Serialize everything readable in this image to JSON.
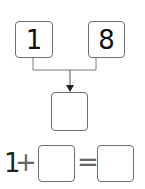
{
  "diagram": {
    "type": "number-bond",
    "top_boxes": [
      {
        "value": "1"
      },
      {
        "value": "8"
      }
    ],
    "result_box": {
      "value": ""
    },
    "equation": {
      "addend1": "1",
      "operator": "+",
      "addend2": "",
      "equals": "=",
      "sum": ""
    },
    "colors": {
      "line": "#7a7a7a",
      "text": "#111111"
    }
  }
}
